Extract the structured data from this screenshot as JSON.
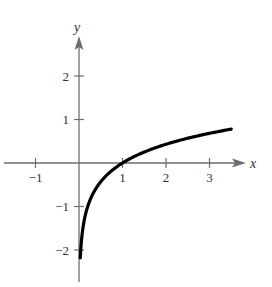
{
  "chart_data": {
    "type": "line",
    "title": "",
    "xlabel": "x",
    "ylabel": "y",
    "xlim": [
      -1.3,
      3.7
    ],
    "ylim": [
      -2.5,
      2.8
    ],
    "grid": false,
    "legend": null,
    "x_ticks": [
      -1,
      1,
      2,
      3
    ],
    "y_ticks": [
      -2,
      -1,
      1,
      2
    ],
    "x_tick_labels": [
      "−1",
      "1",
      "2",
      "3"
    ],
    "y_tick_labels": [
      "−2",
      "−1",
      "1",
      "2"
    ],
    "series": [
      {
        "name": "y = log5 x",
        "x": [
          0.03,
          0.04,
          0.06,
          0.1,
          0.2,
          0.3,
          0.5,
          0.75,
          1,
          1.5,
          2,
          2.5,
          3,
          3.5
        ],
        "y": [
          -2.18,
          -2.0,
          -1.75,
          -1.43,
          -1.0,
          -0.75,
          -0.43,
          -0.18,
          0,
          0.25,
          0.43,
          0.57,
          0.68,
          0.78
        ]
      }
    ],
    "annotations": []
  },
  "axes": {
    "x_name": "x",
    "y_name": "y",
    "ticks_x": [
      {
        "value": -1,
        "label": "−1"
      },
      {
        "value": 1,
        "label": "1"
      },
      {
        "value": 2,
        "label": "2"
      },
      {
        "value": 3,
        "label": "3"
      }
    ],
    "ticks_y": [
      {
        "value": 2,
        "label": "2"
      },
      {
        "value": 1,
        "label": "1"
      },
      {
        "value": -1,
        "label": "−1"
      },
      {
        "value": -2,
        "label": "−2"
      }
    ]
  },
  "colors": {
    "axis": "#6e6e6e",
    "curve": "#000000",
    "text": "#333333"
  }
}
